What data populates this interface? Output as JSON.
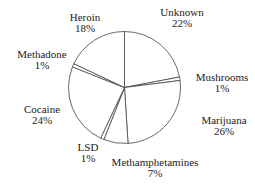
{
  "chart_data": {
    "type": "pie",
    "title": "",
    "start_angle_deg": 0,
    "direction": "clockwise",
    "slices": [
      {
        "label": "Unknown",
        "value": 22,
        "pct_label": "22%"
      },
      {
        "label": "Mushrooms",
        "value": 1,
        "pct_label": "1%"
      },
      {
        "label": "Marijuana",
        "value": 26,
        "pct_label": "26%"
      },
      {
        "label": "Methamphetamines",
        "value": 7,
        "pct_label": "7%"
      },
      {
        "label": "LSD",
        "value": 1,
        "pct_label": "1%"
      },
      {
        "label": "Cocaine",
        "value": 24,
        "pct_label": "24%"
      },
      {
        "label": "Methadone",
        "value": 1,
        "pct_label": "1%"
      },
      {
        "label": "Heroin",
        "value": 18,
        "pct_label": "18%"
      }
    ],
    "colors": {
      "fill": "#ffffff",
      "stroke": "#444444"
    },
    "legend": "none",
    "labels_position": "outside"
  },
  "labels": [
    {
      "name": "Unknown",
      "pct": "22%",
      "x": 182,
      "y": 7
    },
    {
      "name": "Mushrooms",
      "pct": "1%",
      "x": 222,
      "y": 72
    },
    {
      "name": "Marijuana",
      "pct": "26%",
      "x": 224,
      "y": 115
    },
    {
      "name": "Methamphetamines",
      "pct": "7%",
      "x": 155,
      "y": 157
    },
    {
      "name": "LSD",
      "pct": "1%",
      "x": 88,
      "y": 142
    },
    {
      "name": "Cocaine",
      "pct": "24%",
      "x": 42,
      "y": 104
    },
    {
      "name": "Methadone",
      "pct": "1%",
      "x": 42,
      "y": 49
    },
    {
      "name": "Heroin",
      "pct": "18%",
      "x": 85,
      "y": 12
    }
  ]
}
